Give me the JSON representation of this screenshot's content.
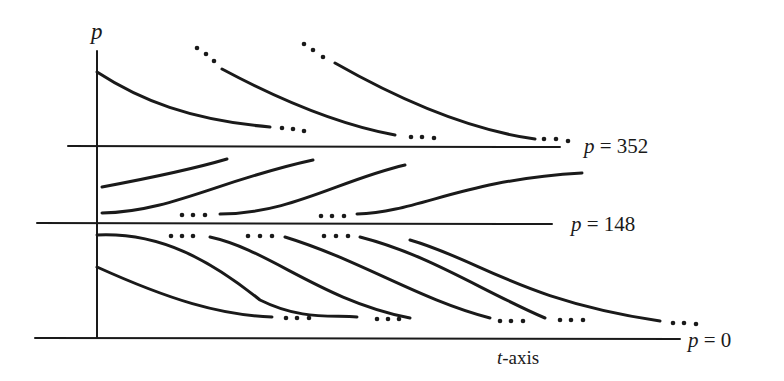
{
  "figure": {
    "type": "phase-line solution curves",
    "vertical_axis_label": "p",
    "horizontal_axis_label": {
      "var": "t",
      "suffix": "-axis"
    },
    "equilibria": [
      {
        "var": "p",
        "eq": " = ",
        "value": "352"
      },
      {
        "var": "p",
        "eq": " = ",
        "value": "148"
      },
      {
        "var": "p",
        "eq": " = ",
        "value": "0"
      }
    ],
    "ellipsis": "•••",
    "colors": {
      "ink": "#1a1a1a",
      "background": "#ffffff"
    }
  }
}
